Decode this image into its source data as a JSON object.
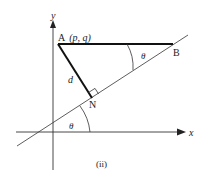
{
  "figure": {
    "caption": "(ii)",
    "axes": {
      "x_label": "x",
      "y_label": "y"
    },
    "points": {
      "A": {
        "name": "A",
        "coords": "(p, q)"
      },
      "B": {
        "name": "B"
      },
      "N": {
        "name": "N"
      }
    },
    "segments": {
      "AN": {
        "label": "d"
      }
    },
    "angles": {
      "at_x_axis": "θ",
      "at_B": "θ"
    },
    "colors": {
      "ink": "#222222",
      "background": "#ffffff"
    }
  }
}
